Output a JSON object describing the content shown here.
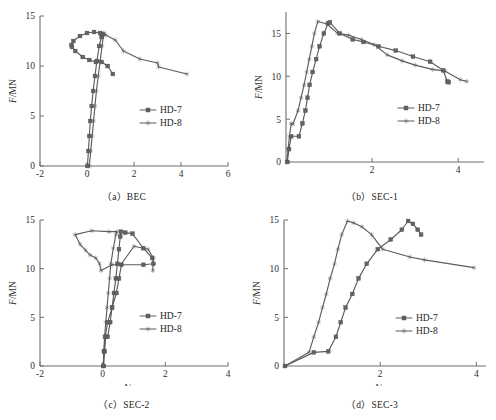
{
  "figure": {
    "panels": [
      "a",
      "b",
      "c",
      "d"
    ]
  },
  "panel_a": {
    "caption": "（a）BEC",
    "xlabel_italic": "Δ",
    "xlabel_rest": "/mm",
    "ylabel_italic": "F",
    "ylabel_rest": "/MN",
    "legend": [
      "HD-7",
      "HD-8"
    ]
  },
  "panel_b": {
    "caption": "（b）SEC-1",
    "xlabel_italic": "Δ",
    "xlabel_rest": "/mm",
    "ylabel_italic": "F",
    "ylabel_rest": "/MN",
    "legend": [
      "HD-7",
      "HD-8"
    ]
  },
  "panel_c": {
    "caption": "（c）SEC-2",
    "xlabel_italic": "Δ",
    "xlabel_rest": "/mm",
    "ylabel_italic": "F",
    "ylabel_rest": "/MN",
    "legend": [
      "HD-7",
      "HD-8"
    ]
  },
  "panel_d": {
    "caption": "（d）SEC-3",
    "xlabel_italic": "Δ",
    "xlabel_rest": "/mm",
    "ylabel_italic": "F",
    "ylabel_rest": "/MN",
    "legend": [
      "HD-7",
      "HD-8"
    ]
  },
  "style": {
    "line_color": "#5c5c5c",
    "axis_color": "#6e6e6e",
    "text_color": "#232323",
    "background": "#ffffff"
  },
  "chart_data": [
    {
      "id": "a",
      "type": "line",
      "title": "(a) BEC",
      "xlabel": "Δ/mm",
      "ylabel": "F/MN",
      "xlim": [
        -2,
        6
      ],
      "ylim": [
        0,
        15
      ],
      "xticks": [
        -2,
        0,
        2,
        4,
        6
      ],
      "yticks": [
        0,
        5,
        10,
        15
      ],
      "grid": false,
      "legend_position": "center-right",
      "series": [
        {
          "name": "HD-7",
          "marker": "square",
          "points": [
            [
              0.02,
              0.0
            ],
            [
              0.06,
              1.5
            ],
            [
              0.1,
              3.0
            ],
            [
              0.14,
              4.5
            ],
            [
              0.2,
              6.0
            ],
            [
              0.26,
              7.5
            ],
            [
              0.34,
              9.0
            ],
            [
              0.42,
              10.5
            ],
            [
              0.52,
              12.0
            ],
            [
              0.62,
              12.9
            ],
            [
              0.66,
              13.2
            ],
            [
              0.56,
              13.3
            ],
            [
              0.3,
              13.4
            ],
            [
              0.0,
              13.3
            ],
            [
              -0.3,
              13.0
            ],
            [
              -0.58,
              12.5
            ],
            [
              -0.66,
              12.1
            ],
            [
              -0.64,
              11.9
            ],
            [
              -0.5,
              11.5
            ],
            [
              -0.18,
              10.9
            ],
            [
              0.1,
              10.6
            ],
            [
              0.38,
              10.4
            ],
            [
              0.62,
              10.4
            ],
            [
              0.88,
              10.0
            ],
            [
              1.1,
              9.2
            ]
          ]
        },
        {
          "name": "HD-8",
          "marker": "star",
          "points": [
            [
              0.1,
              0.0
            ],
            [
              0.16,
              1.5
            ],
            [
              0.22,
              3.0
            ],
            [
              0.28,
              4.5
            ],
            [
              0.34,
              6.0
            ],
            [
              0.4,
              7.5
            ],
            [
              0.48,
              9.0
            ],
            [
              0.56,
              10.5
            ],
            [
              0.64,
              12.0
            ],
            [
              0.7,
              13.0
            ],
            [
              0.72,
              13.3
            ],
            [
              0.8,
              13.1
            ],
            [
              1.2,
              12.6
            ],
            [
              1.55,
              11.5
            ],
            [
              2.25,
              10.7
            ],
            [
              3.0,
              10.3
            ],
            [
              3.05,
              9.9
            ],
            [
              4.25,
              9.2
            ]
          ]
        }
      ]
    },
    {
      "id": "b",
      "type": "line",
      "title": "(b) SEC-1",
      "xlabel": "Δ/mm",
      "ylabel": "F/MN",
      "xlim": [
        0,
        4.6
      ],
      "ylim": [
        0,
        17.5
      ],
      "xticks": [
        2,
        4
      ],
      "yticks": [
        0,
        5,
        10,
        15
      ],
      "grid": false,
      "legend_position": "center-right",
      "series": [
        {
          "name": "HD-7",
          "marker": "square",
          "points": [
            [
              0.03,
              0.0
            ],
            [
              0.07,
              1.5
            ],
            [
              0.12,
              3.0
            ],
            [
              0.3,
              3.0
            ],
            [
              0.38,
              4.5
            ],
            [
              0.45,
              6.0
            ],
            [
              0.5,
              7.5
            ],
            [
              0.55,
              9.0
            ],
            [
              0.62,
              10.5
            ],
            [
              0.7,
              12.0
            ],
            [
              0.78,
              13.5
            ],
            [
              0.88,
              15.0
            ],
            [
              0.98,
              16.2
            ],
            [
              1.02,
              16.3
            ],
            [
              1.25,
              15.0
            ],
            [
              1.55,
              14.3
            ],
            [
              1.8,
              14.0
            ],
            [
              2.15,
              13.5
            ],
            [
              2.55,
              13.0
            ],
            [
              2.95,
              12.3
            ],
            [
              3.35,
              11.7
            ],
            [
              3.65,
              10.7
            ],
            [
              3.75,
              9.4
            ],
            [
              3.78,
              9.3
            ]
          ]
        },
        {
          "name": "HD-8",
          "marker": "star",
          "points": [
            [
              0.02,
              0.0
            ],
            [
              0.05,
              1.5
            ],
            [
              0.08,
              3.0
            ],
            [
              0.12,
              4.5
            ],
            [
              0.16,
              4.4
            ],
            [
              0.28,
              6.0
            ],
            [
              0.35,
              7.5
            ],
            [
              0.42,
              9.0
            ],
            [
              0.48,
              10.5
            ],
            [
              0.54,
              12.0
            ],
            [
              0.6,
              13.5
            ],
            [
              0.66,
              15.0
            ],
            [
              0.74,
              16.4
            ],
            [
              0.95,
              16.1
            ],
            [
              1.2,
              15.0
            ],
            [
              1.45,
              14.8
            ],
            [
              1.75,
              14.3
            ],
            [
              2.05,
              13.7
            ],
            [
              2.35,
              12.5
            ],
            [
              2.7,
              11.8
            ],
            [
              3.0,
              11.3
            ],
            [
              3.4,
              10.8
            ],
            [
              3.7,
              10.6
            ],
            [
              4.05,
              9.6
            ],
            [
              4.2,
              9.4
            ]
          ]
        }
      ]
    },
    {
      "id": "c",
      "type": "line",
      "title": "(c) SEC-2",
      "xlabel": "Δ/mm",
      "ylabel": "F/MN",
      "xlim": [
        -2,
        4
      ],
      "ylim": [
        0,
        15
      ],
      "xticks": [
        -2,
        0,
        2,
        4
      ],
      "yticks": [
        0,
        5,
        10,
        15
      ],
      "grid": false,
      "legend_position": "center-right",
      "series": [
        {
          "name": "HD-7",
          "marker": "square",
          "points": [
            [
              0.03,
              0.0
            ],
            [
              0.06,
              1.5
            ],
            [
              0.1,
              3.0
            ],
            [
              0.16,
              3.0
            ],
            [
              0.24,
              4.5
            ],
            [
              0.3,
              6.0
            ],
            [
              0.36,
              7.5
            ],
            [
              0.42,
              9.0
            ],
            [
              0.47,
              10.5
            ],
            [
              0.52,
              12.0
            ],
            [
              0.56,
              13.3
            ],
            [
              0.58,
              13.8
            ],
            [
              0.72,
              13.7
            ],
            [
              0.95,
              13.6
            ],
            [
              1.3,
              12.1
            ],
            [
              1.58,
              11.1
            ],
            [
              1.62,
              10.5
            ],
            [
              1.3,
              10.4
            ],
            [
              0.6,
              10.4
            ],
            [
              0.52,
              9.0
            ],
            [
              0.44,
              7.5
            ],
            [
              0.3,
              6.0
            ],
            [
              0.16,
              4.5
            ],
            [
              0.08,
              3.0
            ],
            [
              0.04,
              1.5
            ],
            [
              0.02,
              0.0
            ]
          ]
        },
        {
          "name": "HD-8",
          "marker": "star",
          "points": [
            [
              0.02,
              0.0
            ],
            [
              0.04,
              1.5
            ],
            [
              0.06,
              3.0
            ],
            [
              0.1,
              4.5
            ],
            [
              0.14,
              6.0
            ],
            [
              0.18,
              7.5
            ],
            [
              0.22,
              9.0
            ],
            [
              0.26,
              10.5
            ],
            [
              0.34,
              12.1
            ],
            [
              0.42,
              13.5
            ],
            [
              0.46,
              13.8
            ],
            [
              0.2,
              13.8
            ],
            [
              -0.35,
              13.9
            ],
            [
              -0.88,
              13.5
            ],
            [
              -0.72,
              12.5
            ],
            [
              -0.55,
              11.9
            ],
            [
              -0.4,
              11.4
            ],
            [
              -0.22,
              11.1
            ],
            [
              -0.1,
              10.5
            ],
            [
              -0.05,
              9.8
            ],
            [
              0.3,
              10.4
            ],
            [
              0.58,
              10.4
            ],
            [
              1.0,
              12.3
            ],
            [
              1.45,
              12.0
            ],
            [
              1.62,
              11.1
            ],
            [
              1.6,
              9.8
            ]
          ]
        }
      ]
    },
    {
      "id": "d",
      "type": "line",
      "title": "(d) SEC-3",
      "xlabel": "Δ/mm",
      "ylabel": "F/MN",
      "xlim": [
        0,
        4.2
      ],
      "ylim": [
        0,
        15
      ],
      "xticks": [
        2,
        4
      ],
      "yticks": [
        0,
        5,
        10,
        15
      ],
      "grid": false,
      "legend_position": "center-right",
      "series": [
        {
          "name": "HD-7",
          "marker": "square",
          "points": [
            [
              0.02,
              0.0
            ],
            [
              0.62,
              1.4
            ],
            [
              0.92,
              1.5
            ],
            [
              1.08,
              3.0
            ],
            [
              1.18,
              4.5
            ],
            [
              1.28,
              6.0
            ],
            [
              1.42,
              7.4
            ],
            [
              1.55,
              9.0
            ],
            [
              1.72,
              10.5
            ],
            [
              1.95,
              12.0
            ],
            [
              2.22,
              13.0
            ],
            [
              2.45,
              14.0
            ],
            [
              2.58,
              14.9
            ],
            [
              2.68,
              14.6
            ],
            [
              2.78,
              14.0
            ],
            [
              2.85,
              13.5
            ]
          ]
        },
        {
          "name": "HD-8",
          "marker": "star",
          "points": [
            [
              0.02,
              0.0
            ],
            [
              0.52,
              1.4
            ],
            [
              0.62,
              3.0
            ],
            [
              0.72,
              4.5
            ],
            [
              0.8,
              6.0
            ],
            [
              0.88,
              7.4
            ],
            [
              0.96,
              9.0
            ],
            [
              1.05,
              10.5
            ],
            [
              1.12,
              12.0
            ],
            [
              1.2,
              13.5
            ],
            [
              1.32,
              14.9
            ],
            [
              1.45,
              14.7
            ],
            [
              1.62,
              14.3
            ],
            [
              1.82,
              13.5
            ],
            [
              2.05,
              12.0
            ],
            [
              2.62,
              11.2
            ],
            [
              2.92,
              10.9
            ],
            [
              3.95,
              10.1
            ]
          ]
        }
      ]
    }
  ]
}
